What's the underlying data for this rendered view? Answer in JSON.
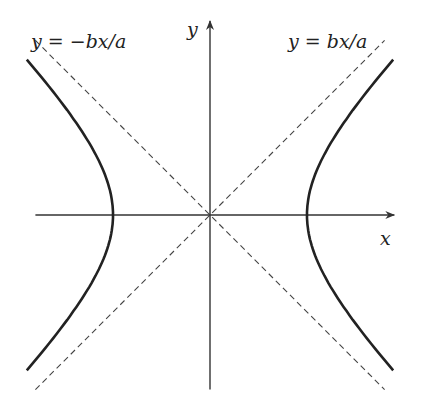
{
  "diagram": {
    "x_axis_label": "x",
    "y_axis_label": "y",
    "asymptote_positive_label": "y = bx/a",
    "asymptote_negative_label": "y = −bx/a",
    "params": {
      "a": 1,
      "b": 1
    },
    "x_range": [
      -1.8,
      1.9
    ],
    "y_range": [
      -1.8,
      2.0
    ],
    "curve_t_max": 1.25,
    "colors": {
      "curve": "#222222",
      "axis": "#333333",
      "asymptote": "#444444",
      "background": "#ffffff"
    }
  }
}
